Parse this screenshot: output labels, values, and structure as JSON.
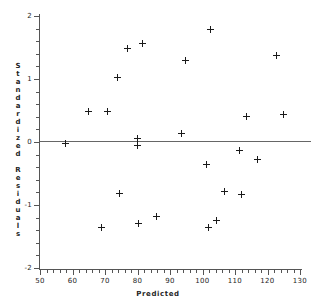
{
  "chart_data": {
    "type": "scatter",
    "title": "",
    "xlabel": "Predicted",
    "ylabel": "Standardized Residuals",
    "xlim": [
      50,
      130
    ],
    "ylim": [
      -2,
      2
    ],
    "xticks": [
      50,
      60,
      70,
      80,
      90,
      100,
      110,
      120,
      130
    ],
    "yticks": [
      -2,
      -1,
      0,
      1,
      2
    ],
    "xtick_labels": [
      "50",
      "60",
      "70",
      "80",
      "90",
      "100",
      "110",
      "120",
      "130"
    ],
    "ytick_labels": [
      "-2",
      "-1",
      "0",
      "1",
      "2"
    ],
    "grid": false,
    "legend": false,
    "reference_line": {
      "orientation": "horizontal",
      "y": 0
    },
    "marker": "plus",
    "points": [
      {
        "x": 57.7,
        "y": -0.03
      },
      {
        "x": 64.8,
        "y": 0.48
      },
      {
        "x": 69.0,
        "y": -1.36
      },
      {
        "x": 70.9,
        "y": 0.48
      },
      {
        "x": 73.7,
        "y": 1.02
      },
      {
        "x": 74.5,
        "y": -0.81
      },
      {
        "x": 77.0,
        "y": 1.49
      },
      {
        "x": 79.9,
        "y": 0.06
      },
      {
        "x": 80.0,
        "y": -0.05
      },
      {
        "x": 80.3,
        "y": -1.3
      },
      {
        "x": 81.6,
        "y": 1.56
      },
      {
        "x": 85.8,
        "y": -1.19
      },
      {
        "x": 93.4,
        "y": 0.14
      },
      {
        "x": 94.7,
        "y": 1.29
      },
      {
        "x": 101.2,
        "y": -0.35
      },
      {
        "x": 101.8,
        "y": -1.36
      },
      {
        "x": 102.6,
        "y": 1.79
      },
      {
        "x": 104.3,
        "y": -1.25
      },
      {
        "x": 106.9,
        "y": -0.79
      },
      {
        "x": 111.5,
        "y": -0.13
      },
      {
        "x": 112.1,
        "y": -0.84
      },
      {
        "x": 113.4,
        "y": 0.41
      },
      {
        "x": 117.0,
        "y": -0.27
      },
      {
        "x": 122.8,
        "y": 1.38
      },
      {
        "x": 125.0,
        "y": 0.44
      }
    ]
  }
}
